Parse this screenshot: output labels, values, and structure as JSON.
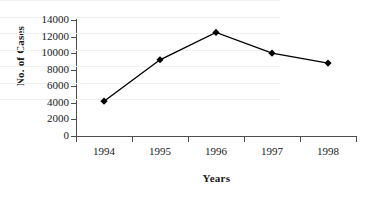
{
  "chart_data": {
    "type": "line",
    "title": "",
    "xlabel": "Years",
    "ylabel": "No. of Cases",
    "categories": [
      "1994",
      "1995",
      "1996",
      "1997",
      "1998"
    ],
    "values": [
      4200,
      9200,
      12500,
      10000,
      8800
    ],
    "series": [
      {
        "name": "No. of Cases",
        "values": [
          4200,
          9200,
          12500,
          10000,
          8800
        ]
      }
    ],
    "ylim": [
      0,
      14000
    ],
    "y_ticks": [
      0,
      2000,
      4000,
      6000,
      8000,
      10000,
      12000,
      14000
    ],
    "y_tick_labels": [
      "0",
      "2000",
      "4000",
      "6000",
      "8000",
      "10000",
      "12000",
      "14000"
    ],
    "grid": true,
    "grid_axis": "y",
    "legend": "none",
    "marker": "diamond",
    "line_color": "#000000",
    "marker_color": "#000000",
    "grid_color": "#f1f1f3",
    "axis_color": "#4d4d4d",
    "background_color": "#ffffff"
  }
}
